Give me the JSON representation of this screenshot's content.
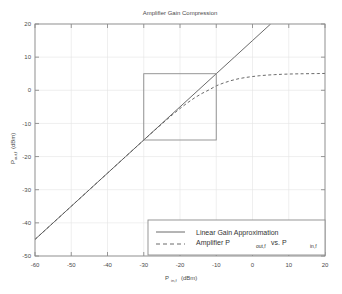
{
  "chart_data": {
    "type": "line",
    "title": "Amplifier Gain Compression",
    "xlabel": "P_in,f (dBm)",
    "xlabel_base": "P",
    "xlabel_sub": "in,f",
    "xlabel_unit": "(dBm)",
    "ylabel": "P_out,f (dBm)",
    "ylabel_base": "P",
    "ylabel_sub": "out,f",
    "ylabel_unit": "(dBm)",
    "xlim": [
      -60,
      20
    ],
    "ylim": [
      -50,
      20
    ],
    "xticks": [
      -60,
      -50,
      -40,
      -30,
      -20,
      -10,
      0,
      10,
      20
    ],
    "yticks": [
      -50,
      -40,
      -30,
      -20,
      -10,
      0,
      10,
      20
    ],
    "grid": true,
    "legend_position": "lower-right",
    "legend": [
      {
        "label": "Linear Gain Approximation",
        "style": "solid",
        "base": "Linear Gain Approximation",
        "sub": "",
        "tail": ""
      },
      {
        "label": "Amplifier P_out,f vs. P_in,f",
        "style": "dashed",
        "base": "Amplifier P",
        "sub": "out,f",
        "mid": " vs. P",
        "sub2": "in,f",
        "tail": ""
      }
    ],
    "annotations": [
      {
        "name": "inset-region-box",
        "type": "rect",
        "x0": -30,
        "x1": -10,
        "y0": -15,
        "y1": 5
      }
    ],
    "series": [
      {
        "name": "Linear Gain Approximation",
        "style": "solid",
        "color": "#595959",
        "x": [
          -60,
          -55,
          -50,
          -45,
          -40,
          -35,
          -30,
          -25,
          -20,
          -15,
          -10,
          -5,
          0,
          5
        ],
        "y": [
          -45,
          -40,
          -35,
          -30,
          -25,
          -20,
          -15,
          -10,
          -5,
          0,
          5,
          10,
          15,
          20
        ]
      },
      {
        "name": "Amplifier P_out,f vs. P_in,f",
        "style": "dashed",
        "color": "#595959",
        "x": [
          -60,
          -55,
          -50,
          -45,
          -40,
          -35,
          -30,
          -28,
          -26,
          -24,
          -22,
          -20,
          -18,
          -16,
          -14,
          -12,
          -10,
          -8,
          -6,
          -4,
          -2,
          0,
          2,
          4,
          6,
          8,
          10,
          12,
          14,
          16,
          18,
          20
        ],
        "y": [
          -45,
          -40,
          -35,
          -30,
          -25,
          -20,
          -15.02,
          -13.05,
          -11.1,
          -9.18,
          -7.3,
          -5.5,
          -3.82,
          -2.3,
          -0.98,
          0.12,
          1.35,
          2.2,
          2.9,
          3.45,
          3.85,
          4.15,
          4.4,
          4.58,
          4.72,
          4.82,
          4.9,
          4.95,
          4.99,
          5.02,
          5.05,
          5.08
        ]
      }
    ]
  },
  "colors": {
    "frame": "#8c8c8c",
    "grid": "#e4e4e4",
    "line": "#595959",
    "text": "#4a4a4a",
    "background": "#ffffff"
  }
}
